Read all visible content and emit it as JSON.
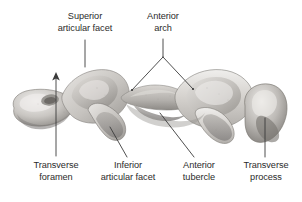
{
  "figure": {
    "background_color": "#ffffff",
    "leader_color": "#3b3b3b",
    "text_color": "#2b2b2b",
    "bone_light": "#e6e4e1",
    "bone_mid": "#c4c1bd",
    "bone_dark": "#8f8c88",
    "bone_shadow": "#6e6b67"
  },
  "labels": {
    "superior_articular_facet": {
      "line1": "Superior",
      "line2": "articular facet"
    },
    "anterior_arch": {
      "line1": "Anterior",
      "line2": "arch"
    },
    "transverse_foramen": {
      "line1": "Transverse",
      "line2": "foramen"
    },
    "inferior_articular_facet": {
      "line1": "Inferior",
      "line2": "articular facet"
    },
    "anterior_tubercle": {
      "line1": "Anterior",
      "line2": "tubercle"
    },
    "transverse_process": {
      "line1": "Transverse",
      "line2": "process"
    }
  }
}
